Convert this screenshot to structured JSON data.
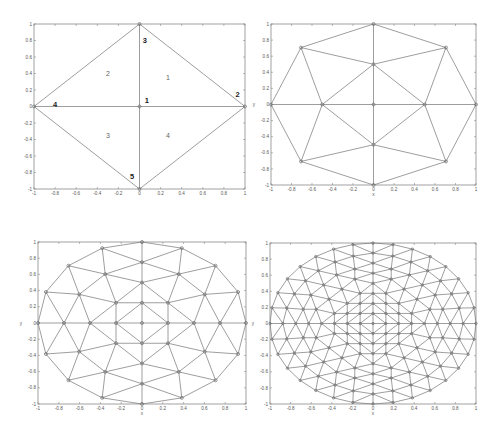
{
  "figure": {
    "panels": [
      {
        "id": "panel-1",
        "box": {
          "left": 34,
          "right": 245,
          "top": 24,
          "bottom": 189
        },
        "xlabel": "",
        "ylabel": "",
        "xticks": [
          "-1",
          "-0.8",
          "-0.6",
          "-0.4",
          "-0.2",
          "0",
          "0.2",
          "0.4",
          "0.6",
          "0.8",
          "1"
        ],
        "yticks": [
          "-1",
          "-0.8",
          "-0.6",
          "-0.4",
          "-0.2",
          "0",
          "0.2",
          "0.4",
          "0.6",
          "0.8",
          "1"
        ],
        "mesh": "level0",
        "node_labels": [
          {
            "text": "1",
            "x": 0.07,
            "y": 0.07
          },
          {
            "text": "2",
            "x": 0.93,
            "y": 0.14
          },
          {
            "text": "3",
            "x": 0.05,
            "y": 0.8
          },
          {
            "text": "4",
            "x": -0.8,
            "y": 0.03
          },
          {
            "text": "5",
            "x": -0.07,
            "y": -0.85
          }
        ],
        "element_labels": [
          {
            "text": "1",
            "x": 0.27,
            "y": 0.35
          },
          {
            "text": "2",
            "x": -0.3,
            "y": 0.4
          },
          {
            "text": "3",
            "x": -0.3,
            "y": -0.35
          },
          {
            "text": "4",
            "x": 0.27,
            "y": -0.35
          }
        ]
      },
      {
        "id": "panel-2",
        "box": {
          "left": 271,
          "right": 476,
          "top": 24,
          "bottom": 185
        },
        "xlabel": "x",
        "ylabel": "y",
        "xticks": [
          "-1",
          "-0.8",
          "-0.6",
          "-0.4",
          "-0.2",
          "0",
          "0.2",
          "0.4",
          "0.6",
          "0.8",
          "1"
        ],
        "yticks": [
          "-1",
          "-0.8",
          "-0.6",
          "-0.4",
          "-0.2",
          "0",
          "0.2",
          "0.4",
          "0.6",
          "0.8",
          "1"
        ],
        "mesh": "level1"
      },
      {
        "id": "panel-3",
        "box": {
          "left": 38,
          "right": 246,
          "top": 242,
          "bottom": 404
        },
        "xlabel": "x",
        "ylabel": "y",
        "xticks": [
          "-1",
          "-0.8",
          "-0.6",
          "-0.4",
          "-0.2",
          "0",
          "0.2",
          "0.4",
          "0.6",
          "0.8",
          "1"
        ],
        "yticks": [
          "-1",
          "-0.8",
          "-0.6",
          "-0.4",
          "-0.2",
          "0",
          "0.2",
          "0.4",
          "0.6",
          "0.8",
          "1"
        ],
        "mesh": "level2"
      },
      {
        "id": "panel-4",
        "box": {
          "left": 270,
          "right": 476,
          "top": 243,
          "bottom": 404
        },
        "xlabel": "x",
        "ylabel": "y",
        "xticks": [
          "-1",
          "-0.8",
          "-0.6",
          "-0.4",
          "-0.2",
          "0",
          "0.2",
          "0.4",
          "0.6",
          "0.8",
          "1"
        ],
        "yticks": [
          "-1",
          "-0.8",
          "-0.6",
          "-0.4",
          "-0.2",
          "0",
          "0.2",
          "0.4",
          "0.6",
          "0.8",
          "1"
        ],
        "mesh": "level3"
      }
    ]
  },
  "colors": {
    "edge": "#7d7d7d",
    "axis": "#8a8a8a",
    "background": "#ffffff"
  }
}
